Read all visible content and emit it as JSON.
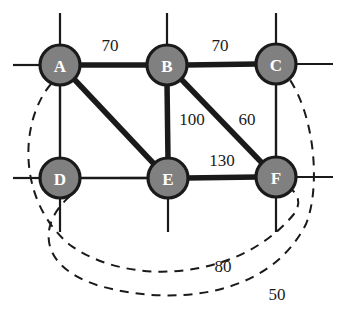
{
  "diagram": {
    "colors": {
      "node_fill": "#808080",
      "node_stroke": "#1a1a1a",
      "node_text": "#ffffff",
      "edge_solid": "#1a1a1a",
      "edge_thin": "#1a1a1a",
      "edge_dashed": "#1a1a1a",
      "label_text": "#1a1a1a",
      "background": "#ffffff"
    },
    "nodes": [
      {
        "id": "A",
        "label": "A",
        "x": 60,
        "y": 65,
        "r": 20
      },
      {
        "id": "B",
        "label": "B",
        "x": 167,
        "y": 65,
        "r": 20
      },
      {
        "id": "C",
        "label": "C",
        "x": 276,
        "y": 64,
        "r": 20
      },
      {
        "id": "D",
        "label": "D",
        "x": 60,
        "y": 178,
        "r": 20
      },
      {
        "id": "E",
        "label": "E",
        "x": 168,
        "y": 178,
        "r": 20
      },
      {
        "id": "F",
        "label": "F",
        "x": 276,
        "y": 177,
        "r": 20
      }
    ],
    "edges": [
      {
        "from": "A",
        "to": "B",
        "weight": "70",
        "style": "thick",
        "label_x": 110,
        "label_y": 45
      },
      {
        "from": "B",
        "to": "C",
        "weight": "70",
        "style": "thick",
        "label_x": 220,
        "label_y": 45
      },
      {
        "from": "B",
        "to": "E",
        "weight": "100",
        "style": "thick",
        "label_x": 192,
        "label_y": 119
      },
      {
        "from": "B",
        "to": "F",
        "weight": "60",
        "style": "thick",
        "label_x": 247,
        "label_y": 119
      },
      {
        "from": "E",
        "to": "F",
        "weight": "130",
        "style": "thick",
        "label_x": 222,
        "label_y": 160
      },
      {
        "from": "A",
        "to": "E",
        "weight": "",
        "style": "thick",
        "label_x": 0,
        "label_y": 0
      },
      {
        "from": "A",
        "to": "D",
        "weight": "",
        "style": "thin",
        "label_x": 0,
        "label_y": 0
      },
      {
        "from": "D",
        "to": "E",
        "weight": "",
        "style": "thin",
        "label_x": 0,
        "label_y": 0
      },
      {
        "from": "C",
        "to": "F",
        "weight": "",
        "style": "thin",
        "label_x": 0,
        "label_y": 0
      }
    ],
    "dashed_edges": [
      {
        "from": "A",
        "to": "F",
        "weight": "80",
        "label_x": 223,
        "label_y": 266
      },
      {
        "from": "D",
        "to": "C",
        "weight": "50",
        "label_x": 277,
        "label_y": 294
      }
    ],
    "stubs": [
      {
        "node": "A",
        "dir": "up"
      },
      {
        "node": "A",
        "dir": "left"
      },
      {
        "node": "B",
        "dir": "up"
      },
      {
        "node": "B",
        "dir": "left"
      },
      {
        "node": "C",
        "dir": "up"
      },
      {
        "node": "C",
        "dir": "right"
      },
      {
        "node": "C",
        "dir": "down"
      },
      {
        "node": "D",
        "dir": "left"
      },
      {
        "node": "D",
        "dir": "down"
      },
      {
        "node": "E",
        "dir": "down"
      },
      {
        "node": "E",
        "dir": "left"
      },
      {
        "node": "F",
        "dir": "right"
      },
      {
        "node": "F",
        "dir": "down"
      }
    ]
  }
}
